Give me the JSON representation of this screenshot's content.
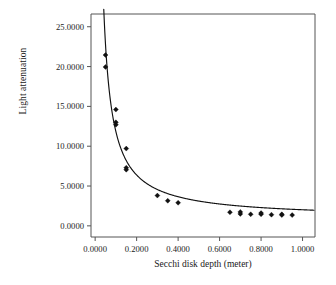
{
  "chart_data": {
    "type": "scatter",
    "title": "",
    "xlabel": "Secchi disk depth (meter)",
    "ylabel": "Light attenuation",
    "xlim": [
      -0.02,
      1.06
    ],
    "ylim": [
      -1.4,
      26.6
    ],
    "xticks": [
      0.0,
      0.2,
      0.4,
      0.6,
      0.8,
      1.0
    ],
    "xticklabels": [
      "0.0000",
      "0.2000",
      "0.4000",
      "0.6000",
      "0.8000",
      "1.0000"
    ],
    "yticks": [
      0.0,
      5.0,
      10.0,
      15.0,
      20.0,
      25.0
    ],
    "yticklabels": [
      "0.0000",
      "5.0000",
      "10.0000",
      "15.0000",
      "20.0000",
      "25.0000"
    ],
    "grid": false,
    "legend": null,
    "marker": "diamond",
    "marker_color": "#111111",
    "curve_color": "#111111",
    "points": [
      {
        "x": 0.05,
        "y": 21.45
      },
      {
        "x": 0.05,
        "y": 19.95
      },
      {
        "x": 0.1,
        "y": 14.6
      },
      {
        "x": 0.1,
        "y": 13.0
      },
      {
        "x": 0.1,
        "y": 12.7
      },
      {
        "x": 0.15,
        "y": 9.7
      },
      {
        "x": 0.15,
        "y": 7.3
      },
      {
        "x": 0.15,
        "y": 7.05
      },
      {
        "x": 0.3,
        "y": 3.8
      },
      {
        "x": 0.35,
        "y": 3.15
      },
      {
        "x": 0.4,
        "y": 2.9
      },
      {
        "x": 0.65,
        "y": 1.7
      },
      {
        "x": 0.7,
        "y": 1.75
      },
      {
        "x": 0.7,
        "y": 1.5
      },
      {
        "x": 0.75,
        "y": 1.45
      },
      {
        "x": 0.8,
        "y": 1.6
      },
      {
        "x": 0.8,
        "y": 1.45
      },
      {
        "x": 0.85,
        "y": 1.4
      },
      {
        "x": 0.9,
        "y": 1.45
      },
      {
        "x": 0.9,
        "y": 1.35
      },
      {
        "x": 0.95,
        "y": 1.35
      }
    ],
    "fit_curve": {
      "form": "y = a/x + b",
      "a": 1.09,
      "b": 0.93,
      "x_start": 0.0415,
      "x_end": 1.055
    }
  }
}
